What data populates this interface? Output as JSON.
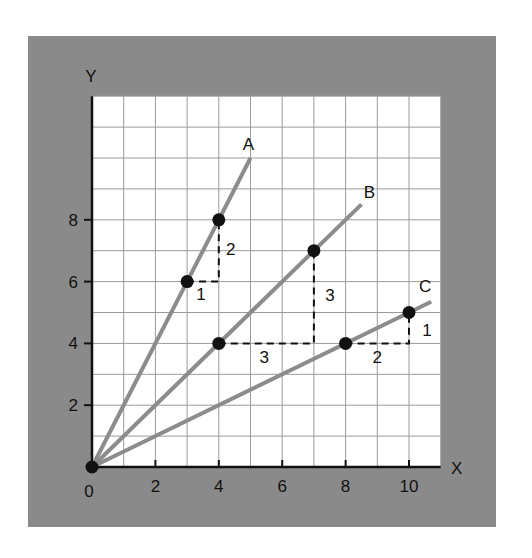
{
  "colors": {
    "frame": "#8a8a8a",
    "plot_bg": "#ffffff",
    "grid": "#9a9a9a",
    "line": "#8c8c8c",
    "point": "#111111",
    "axis": "#111111"
  },
  "axes": {
    "x_label": "X",
    "y_label": "Y",
    "origin_label": "0",
    "x_ticks": [
      "2",
      "4",
      "6",
      "8",
      "10"
    ],
    "y_ticks": [
      "2",
      "4",
      "6",
      "8"
    ]
  },
  "lines": [
    {
      "label": "A",
      "slope": 2,
      "end": [
        5,
        10
      ],
      "points": [
        [
          3,
          6
        ],
        [
          4,
          8
        ]
      ],
      "rise_label": "2",
      "run_label": "1"
    },
    {
      "label": "B",
      "slope": 1,
      "end": [
        8.5,
        8.5
      ],
      "points": [
        [
          4,
          4
        ],
        [
          7,
          7
        ]
      ],
      "rise_label": "3",
      "run_label": "3"
    },
    {
      "label": "C",
      "slope": 0.5,
      "end": [
        10.7,
        5.35
      ],
      "points": [
        [
          8,
          4
        ],
        [
          10,
          5
        ]
      ],
      "rise_label": "1",
      "run_label": "2"
    }
  ],
  "chart_data": {
    "type": "line",
    "title": "",
    "xlabel": "X",
    "ylabel": "Y",
    "xlim": [
      0,
      11
    ],
    "ylim": [
      0,
      12
    ],
    "grid": true,
    "series": [
      {
        "name": "A",
        "x": [
          0,
          3,
          4,
          5
        ],
        "y": [
          0,
          6,
          8,
          10
        ],
        "slope": 2,
        "rise": 2,
        "run": 1
      },
      {
        "name": "B",
        "x": [
          0,
          4,
          7,
          8.5
        ],
        "y": [
          0,
          4,
          7,
          8.5
        ],
        "slope": 1,
        "rise": 3,
        "run": 3
      },
      {
        "name": "C",
        "x": [
          0,
          8,
          10,
          10.7
        ],
        "y": [
          0,
          4,
          5,
          5.35
        ],
        "slope": 0.5,
        "rise": 1,
        "run": 2
      }
    ],
    "annotations": [
      "A",
      "B",
      "C",
      "1",
      "2",
      "3",
      "3",
      "2",
      "1"
    ]
  }
}
